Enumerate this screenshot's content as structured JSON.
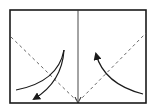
{
  "diagram": {
    "type": "origami-fold-step",
    "colors": {
      "line": "#1a1a1a",
      "dashed": "#555555",
      "background": "#ffffff"
    },
    "frame": {
      "x": 10,
      "y": 10,
      "width": 136,
      "height": 93
    },
    "center_fold": {
      "x1": 78,
      "y1": 10,
      "x2": 78,
      "y2": 103,
      "style": "solid",
      "arrowhead_end": true
    },
    "valley_folds": [
      {
        "x1": 11,
        "y1": 37,
        "x2": 78,
        "y2": 102,
        "style": "dashed"
      },
      {
        "x1": 78,
        "y1": 102,
        "x2": 146,
        "y2": 33,
        "style": "dashed"
      }
    ],
    "fold_arrows": [
      {
        "name": "left-fold-curve",
        "d": "M64,50 Q58,82 16,90",
        "arrowhead": false
      },
      {
        "name": "left-fold-arrow",
        "d": "M64,50 Q62,82 33,100",
        "arrowhead": true
      },
      {
        "name": "right-fold-arrow",
        "d": "M143,94 Q104,84 96,52",
        "arrowhead": true
      }
    ]
  }
}
